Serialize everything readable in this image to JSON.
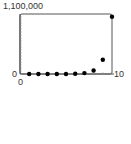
{
  "chart_data": {
    "type": "scatter",
    "title": "",
    "xlabel": "",
    "ylabel": "",
    "xlim": [
      0,
      10
    ],
    "ylim": [
      0,
      1100000
    ],
    "x_tick_labels": [
      "0",
      "10"
    ],
    "y_tick_labels": [
      "0",
      "1,100,000"
    ],
    "y_minor_ticks": 20,
    "grid": false,
    "legend": null,
    "x": [
      1,
      2,
      3,
      4,
      5,
      6,
      7,
      8,
      9,
      10
    ],
    "y": [
      4,
      16,
      64,
      256,
      1024,
      4096,
      16384,
      65536,
      262144,
      1048576
    ],
    "colors": {
      "points": "#000000",
      "axes": "#555555",
      "text": "#333333"
    }
  },
  "labels": {
    "y_max": "1,100,000",
    "y_min": "0",
    "x_min": "0",
    "x_max": "10"
  }
}
